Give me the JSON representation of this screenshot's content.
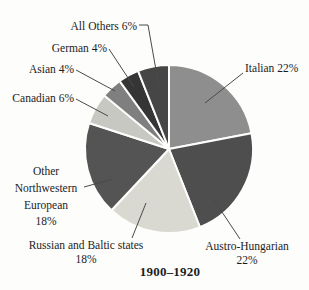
{
  "figure": {
    "title": "1900–1920"
  },
  "labels": {
    "all_others": "All Others 6%",
    "german": "German 4%",
    "asian": "Asian 4%",
    "canadian": "Canadian 6%",
    "italian": "Italian 22%",
    "other_nw": [
      "Other",
      "Northwestern",
      "European",
      "18%"
    ],
    "russian": [
      "Russian and Baltic states",
      "18%"
    ],
    "austro": [
      "Austro-Hungarian",
      "22%"
    ]
  },
  "chart_data": {
    "type": "pie",
    "title": "1900–1920",
    "unit": "percent",
    "start_angle_deg": 0,
    "direction": "clockwise",
    "legend": "none",
    "labels_style": "outside-with-leader-lines",
    "categories": [
      "Italian",
      "Austro-Hungarian",
      "Russian and Baltic states",
      "Other Northwestern European",
      "Canadian",
      "Asian",
      "German",
      "All Others"
    ],
    "values": [
      22,
      22,
      18,
      18,
      6,
      4,
      4,
      6
    ],
    "colors": [
      "#8e8e8e",
      "#4e4e4e",
      "#d9d9d1",
      "#545454",
      "#c8c8c2",
      "#7f7f7f",
      "#353535",
      "#464646"
    ],
    "slice_ids": [
      "italian",
      "austro-hungarian",
      "russian-baltic",
      "other-northwestern-european",
      "canadian",
      "asian",
      "german",
      "all-others"
    ],
    "geometry": {
      "cx": 169,
      "cy": 149,
      "r": 84,
      "gap_stroke": "#fdfdfc",
      "gap_width": 2
    }
  }
}
